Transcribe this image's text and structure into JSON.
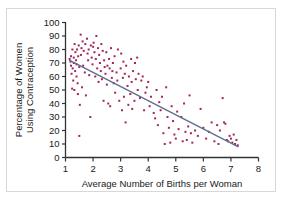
{
  "figure": {
    "border_color": "#d8d8d8",
    "background": "#ffffff"
  },
  "caption_partial": "",
  "chart_data": {
    "type": "scatter",
    "title": "",
    "xlabel": "Average Number of Births per Woman",
    "ylabel": "Percentage of Women Using Contraception",
    "ylabel_line1": "Percentage of Women",
    "ylabel_line2": "Using Contraception",
    "xlim": [
      1,
      8
    ],
    "ylim": [
      0,
      100
    ],
    "xticks": [
      1,
      2,
      3,
      4,
      5,
      6,
      7,
      8
    ],
    "yticks": [
      0,
      10,
      20,
      30,
      40,
      50,
      60,
      70,
      80,
      90,
      100
    ],
    "xtick_labels": [
      "1",
      "2",
      "3",
      "4",
      "5",
      "6",
      "7",
      "8"
    ],
    "ytick_labels": [
      "0",
      "10",
      "20",
      "30",
      "40",
      "50",
      "60",
      "70",
      "80",
      "90",
      "100"
    ],
    "grid": false,
    "legend": "none",
    "marker": {
      "shape": "square",
      "size_px": 2,
      "color": "#a3275c"
    },
    "trendline": {
      "name": "least-squares regression line",
      "color": "#5d6f8c",
      "width_px": 1.4,
      "x_start": 1.15,
      "y_start": 72,
      "x_end": 7.25,
      "y_end": 8
    },
    "axis_color": "#333333",
    "points": [
      [
        1.15,
        73
      ],
      [
        1.18,
        71
      ],
      [
        1.2,
        75
      ],
      [
        1.2,
        68
      ],
      [
        1.22,
        62
      ],
      [
        1.24,
        51
      ],
      [
        1.25,
        80
      ],
      [
        1.26,
        66
      ],
      [
        1.28,
        57
      ],
      [
        1.3,
        74
      ],
      [
        1.3,
        70
      ],
      [
        1.32,
        50
      ],
      [
        1.33,
        84
      ],
      [
        1.35,
        64
      ],
      [
        1.36,
        78
      ],
      [
        1.38,
        72
      ],
      [
        1.4,
        69
      ],
      [
        1.4,
        60
      ],
      [
        1.42,
        80
      ],
      [
        1.44,
        55
      ],
      [
        1.45,
        47
      ],
      [
        1.46,
        75
      ],
      [
        1.48,
        83
      ],
      [
        1.5,
        16
      ],
      [
        1.5,
        67
      ],
      [
        1.52,
        39
      ],
      [
        1.55,
        91
      ],
      [
        1.56,
        76
      ],
      [
        1.58,
        81
      ],
      [
        1.6,
        52
      ],
      [
        1.62,
        86
      ],
      [
        1.64,
        68
      ],
      [
        1.66,
        79
      ],
      [
        1.7,
        63
      ],
      [
        1.72,
        84
      ],
      [
        1.74,
        46
      ],
      [
        1.78,
        88
      ],
      [
        1.8,
        77
      ],
      [
        1.82,
        72
      ],
      [
        1.84,
        80
      ],
      [
        1.86,
        61
      ],
      [
        1.9,
        30
      ],
      [
        1.92,
        83
      ],
      [
        1.95,
        74
      ],
      [
        1.98,
        69
      ],
      [
        2.0,
        82
      ],
      [
        2.02,
        85
      ],
      [
        2.05,
        78
      ],
      [
        2.08,
        60
      ],
      [
        2.1,
        73
      ],
      [
        2.12,
        90
      ],
      [
        2.15,
        66
      ],
      [
        2.18,
        81
      ],
      [
        2.2,
        56
      ],
      [
        2.22,
        76
      ],
      [
        2.25,
        70
      ],
      [
        2.28,
        64
      ],
      [
        2.3,
        84
      ],
      [
        2.32,
        58
      ],
      [
        2.35,
        79
      ],
      [
        2.38,
        42
      ],
      [
        2.4,
        72
      ],
      [
        2.42,
        67
      ],
      [
        2.45,
        62
      ],
      [
        2.48,
        78
      ],
      [
        2.5,
        54
      ],
      [
        2.52,
        68
      ],
      [
        2.55,
        40
      ],
      [
        2.58,
        73
      ],
      [
        2.6,
        66
      ],
      [
        2.62,
        38
      ],
      [
        2.65,
        81
      ],
      [
        2.68,
        59
      ],
      [
        2.7,
        64
      ],
      [
        2.72,
        70
      ],
      [
        2.75,
        55
      ],
      [
        2.78,
        75
      ],
      [
        2.8,
        48
      ],
      [
        2.85,
        63
      ],
      [
        2.88,
        57
      ],
      [
        2.9,
        80
      ],
      [
        2.95,
        42
      ],
      [
        3.0,
        66
      ],
      [
        3.02,
        77
      ],
      [
        3.05,
        35
      ],
      [
        3.08,
        59
      ],
      [
        3.1,
        71
      ],
      [
        3.12,
        45
      ],
      [
        3.15,
        62
      ],
      [
        3.18,
        26
      ],
      [
        3.2,
        68
      ],
      [
        3.25,
        53
      ],
      [
        3.28,
        39
      ],
      [
        3.3,
        60
      ],
      [
        3.35,
        47
      ],
      [
        3.38,
        73
      ],
      [
        3.4,
        56
      ],
      [
        3.42,
        36
      ],
      [
        3.45,
        64
      ],
      [
        3.5,
        42
      ],
      [
        3.52,
        70
      ],
      [
        3.55,
        58
      ],
      [
        3.6,
        74
      ],
      [
        3.62,
        50
      ],
      [
        3.65,
        62
      ],
      [
        3.7,
        44
      ],
      [
        3.75,
        57
      ],
      [
        3.8,
        60
      ],
      [
        3.85,
        35
      ],
      [
        3.9,
        48
      ],
      [
        3.95,
        52
      ],
      [
        4.0,
        56
      ],
      [
        4.05,
        38
      ],
      [
        4.1,
        45
      ],
      [
        4.2,
        33
      ],
      [
        4.25,
        29
      ],
      [
        4.3,
        50
      ],
      [
        4.35,
        24
      ],
      [
        4.4,
        41
      ],
      [
        4.45,
        35
      ],
      [
        4.5,
        45
      ],
      [
        4.55,
        18
      ],
      [
        4.6,
        10
      ],
      [
        4.65,
        52
      ],
      [
        4.7,
        30
      ],
      [
        4.75,
        22
      ],
      [
        4.8,
        11
      ],
      [
        4.85,
        38
      ],
      [
        4.9,
        27
      ],
      [
        4.95,
        17
      ],
      [
        5.0,
        14
      ],
      [
        5.05,
        34
      ],
      [
        5.1,
        21
      ],
      [
        5.2,
        30
      ],
      [
        5.25,
        12
      ],
      [
        5.3,
        40
      ],
      [
        5.35,
        19
      ],
      [
        5.4,
        13
      ],
      [
        5.45,
        23
      ],
      [
        5.5,
        46
      ],
      [
        5.55,
        18
      ],
      [
        5.6,
        11
      ],
      [
        5.7,
        20
      ],
      [
        5.8,
        16
      ],
      [
        5.9,
        36
      ],
      [
        6.0,
        22
      ],
      [
        6.1,
        14
      ],
      [
        6.2,
        19
      ],
      [
        6.3,
        26
      ],
      [
        6.4,
        12
      ],
      [
        6.5,
        24
      ],
      [
        6.55,
        10
      ],
      [
        6.6,
        20
      ],
      [
        6.7,
        44
      ],
      [
        6.75,
        26
      ],
      [
        6.8,
        25
      ],
      [
        6.85,
        13
      ],
      [
        6.9,
        12
      ],
      [
        6.95,
        16
      ],
      [
        7.0,
        14
      ],
      [
        7.05,
        11
      ],
      [
        7.1,
        17
      ],
      [
        7.15,
        10
      ],
      [
        7.2,
        13
      ],
      [
        7.25,
        9
      ]
    ]
  }
}
